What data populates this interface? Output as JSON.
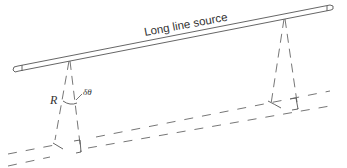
{
  "diagram": {
    "title_label": "Long line source",
    "radius_label": "R",
    "angle_label": "δθ",
    "colors": {
      "stroke": "#555555",
      "text": "#333333",
      "background": "#ffffff"
    },
    "elements": [
      {
        "id": "line-source",
        "type": "tube",
        "label": "Long line source"
      },
      {
        "id": "left-fan",
        "type": "dashed-ray-pair",
        "annotation": [
          "R",
          "δθ"
        ]
      },
      {
        "id": "right-fan",
        "type": "dashed-ray-pair"
      },
      {
        "id": "receiver-strip",
        "type": "dashed-parallel-lines"
      }
    ]
  }
}
